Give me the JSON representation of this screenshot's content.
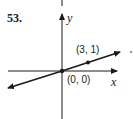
{
  "problem": {
    "number": "53."
  },
  "axes": {
    "x_label": "x",
    "y_label": "y"
  },
  "points": [
    {
      "label": "(0, 0)",
      "x": 0,
      "y": 0
    },
    {
      "label": "(3, 1)",
      "x": 3,
      "y": 1
    }
  ],
  "line": {
    "equation": "y = x/3",
    "slope": "1/3",
    "through": [
      "(0, 0)",
      "(3, 1)"
    ]
  },
  "colors": {
    "stroke": "#1a1a1a",
    "background": "#ffffff"
  }
}
